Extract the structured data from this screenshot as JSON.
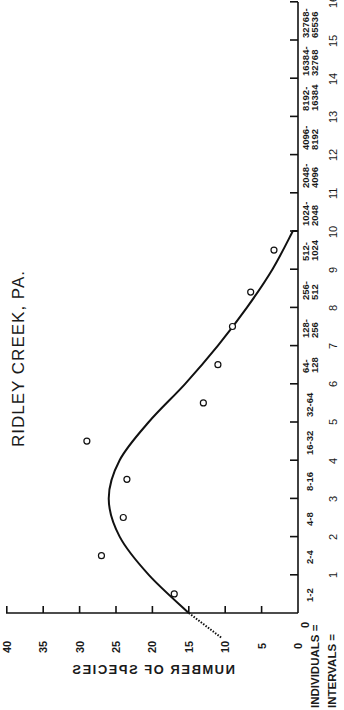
{
  "chart_data": {
    "type": "scatter",
    "title": "RIDLEY CREEK, PA.",
    "orientation": "rotated 90deg counter-clockwise (x-axis vertical on right, y-axis horizontal at bottom)",
    "xlabel_rows": {
      "individuals_prefix": "INDIVIDUALS =",
      "intervals_prefix": "INTERVALS =",
      "individuals_zero": "0",
      "intervals_zero": "0"
    },
    "ylabel": "NUMBER OF SPECIES",
    "ylim": [
      0,
      40
    ],
    "yticks": [
      0,
      5,
      10,
      15,
      20,
      25,
      30,
      35,
      40
    ],
    "xlim": [
      0,
      16
    ],
    "xticks": [
      1,
      2,
      3,
      4,
      5,
      6,
      7,
      8,
      9,
      10,
      11,
      12,
      13,
      14,
      15,
      16
    ],
    "categories": [
      {
        "interval": 1,
        "individuals_top": "1-2",
        "individuals_bottom": ""
      },
      {
        "interval": 2,
        "individuals_top": "2-4",
        "individuals_bottom": ""
      },
      {
        "interval": 3,
        "individuals_top": "4-8",
        "individuals_bottom": ""
      },
      {
        "interval": 4,
        "individuals_top": "8-16",
        "individuals_bottom": ""
      },
      {
        "interval": 5,
        "individuals_top": "16-32",
        "individuals_bottom": ""
      },
      {
        "interval": 6,
        "individuals_top": "32-64",
        "individuals_bottom": ""
      },
      {
        "interval": 7,
        "individuals_top": "64-",
        "individuals_bottom": "128"
      },
      {
        "interval": 8,
        "individuals_top": "128-",
        "individuals_bottom": "256"
      },
      {
        "interval": 9,
        "individuals_top": "256-",
        "individuals_bottom": "512"
      },
      {
        "interval": 10,
        "individuals_top": "512-",
        "individuals_bottom": "1024"
      },
      {
        "interval": 11,
        "individuals_top": "1024-",
        "individuals_bottom": "2048"
      },
      {
        "interval": 12,
        "individuals_top": "2048-",
        "individuals_bottom": "4096"
      },
      {
        "interval": 13,
        "individuals_top": "4096-",
        "individuals_bottom": "8192"
      },
      {
        "interval": 14,
        "individuals_top": "8192-",
        "individuals_bottom": "16384"
      },
      {
        "interval": 15,
        "individuals_top": "16384-",
        "individuals_bottom": "32768"
      },
      {
        "interval": 16,
        "individuals_top": "32768-",
        "individuals_bottom": "65536"
      }
    ],
    "series": [
      {
        "name": "Observed species per octave",
        "marker": "open circle",
        "points": [
          {
            "interval": 0.5,
            "species": 17
          },
          {
            "interval": 1.5,
            "species": 27
          },
          {
            "interval": 2.5,
            "species": 24
          },
          {
            "interval": 3.5,
            "species": 23.5
          },
          {
            "interval": 4.5,
            "species": 29
          },
          {
            "interval": 5.5,
            "species": 13
          },
          {
            "interval": 6.5,
            "species": 11
          },
          {
            "interval": 7.5,
            "species": 9
          },
          {
            "interval": 8.4,
            "species": 6.5
          },
          {
            "interval": 9.5,
            "species": 3.3
          }
        ]
      },
      {
        "name": "Fitted lognormal curve",
        "style": "solid line",
        "points": [
          {
            "interval": 0,
            "species": 15
          },
          {
            "interval": 1,
            "species": 20.5
          },
          {
            "interval": 2,
            "species": 24.5
          },
          {
            "interval": 3,
            "species": 26
          },
          {
            "interval": 4,
            "species": 24.5
          },
          {
            "interval": 5,
            "species": 20.5
          },
          {
            "interval": 6,
            "species": 15.5
          },
          {
            "interval": 7,
            "species": 11
          },
          {
            "interval": 8,
            "species": 7
          },
          {
            "interval": 9,
            "species": 3.5
          },
          {
            "interval": 10,
            "species": 0.7
          },
          {
            "interval": 10,
            "species": 0
          }
        ]
      },
      {
        "name": "Extrapolated curve",
        "style": "dotted line",
        "points": [
          {
            "interval": 0,
            "species": 15
          },
          {
            "interval": -0.65,
            "species": 10.5
          }
        ]
      }
    ],
    "grid": false,
    "legend": null
  }
}
